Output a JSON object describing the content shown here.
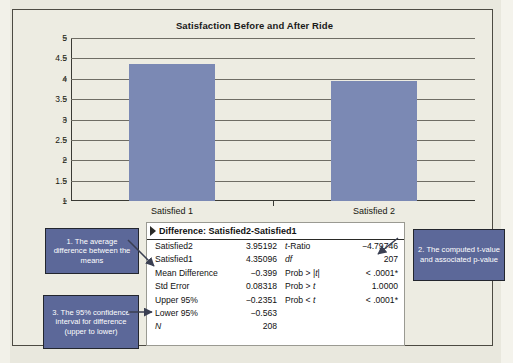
{
  "chart_data": {
    "type": "bar",
    "title": "Satisfaction Before and After Ride",
    "categories": [
      "Satisfied 1",
      "Satisfied 2"
    ],
    "values": [
      4.35096,
      3.95192
    ],
    "xlabel": "",
    "ylabel": "",
    "ylim": [
      1,
      5
    ],
    "yticks": [
      "5",
      "4.5",
      "4",
      "3.5",
      "3",
      "2.5",
      "2",
      "1.5",
      "1"
    ],
    "ytick_values": [
      5,
      4.5,
      4,
      3.5,
      3,
      2.5,
      2,
      1.5,
      1
    ],
    "grid": true,
    "legend": false,
    "bar_color": "#7b89b4"
  },
  "results_panel": {
    "title": "Difference: Satisfied2-Satisfied1",
    "disclosure_icon": "triangle-right-icon",
    "left_rows": [
      {
        "label": "Satisfied2",
        "value": "3.95192"
      },
      {
        "label": "Satisfied1",
        "value": "4.35096"
      },
      {
        "label": "Mean Difference",
        "value": "−0.399"
      },
      {
        "label": "Std Error",
        "value": "0.08318"
      },
      {
        "label": "Upper 95%",
        "value": "−0.2351"
      },
      {
        "label": "Lower 95%",
        "value": "−0.563"
      },
      {
        "label": "N",
        "value": "208"
      }
    ],
    "right_rows": [
      {
        "label": "t-Ratio",
        "value": "−4.79746"
      },
      {
        "label": "df",
        "value": "207"
      },
      {
        "label": "Prob > |t|",
        "value": "< .0001*"
      },
      {
        "label": "Prob > t",
        "value": "1.0000"
      },
      {
        "label": "Prob < t",
        "value": "< .0001*"
      }
    ]
  },
  "callouts": {
    "one": "1. The average difference between the means",
    "two": "2. The computed t-value and associated p-value",
    "three": "3. The 95% confidence interval for difference (upper to lower)"
  },
  "colors": {
    "bar": "#7b89b4",
    "callout_fill": "#5c6899",
    "page_background": "#edece2",
    "frame_border": "#4c4a42"
  }
}
